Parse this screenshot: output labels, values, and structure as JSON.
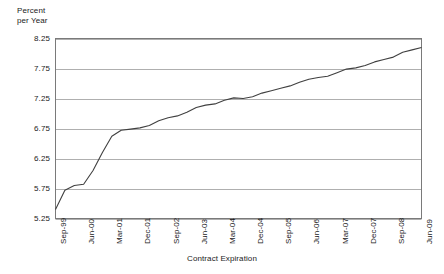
{
  "chart_data": {
    "type": "line",
    "title": "",
    "xlabel": "Contract Expiration",
    "ylabel": "Percent\nper Year",
    "ylabel_line1": "Percent",
    "ylabel_line2": "per Year",
    "ylim": [
      5.25,
      8.25
    ],
    "ytick_labels": [
      "8.25",
      "7.75",
      "7.25",
      "6.75",
      "6.25",
      "5.75",
      "5.25"
    ],
    "ytick_values": [
      8.25,
      7.75,
      7.25,
      6.75,
      6.25,
      5.75,
      5.25
    ],
    "xtick_labels": [
      "Sep-99",
      "Jun-00",
      "Mar-01",
      "Dec-01",
      "Sep-02",
      "Jun-03",
      "Mar-04",
      "Dec-04",
      "Sep-05",
      "Jun-06",
      "Mar-07",
      "Dec-07",
      "Sep-08",
      "Jun-09"
    ],
    "grid": "horizontal",
    "legend": "none",
    "line_color": "#404040",
    "series_name": "Forward rate curve",
    "x": [
      "Sep-99",
      "Dec-99",
      "Mar-00",
      "Jun-00",
      "Sep-00",
      "Dec-00",
      "Mar-01",
      "Jun-01",
      "Sep-01",
      "Dec-01",
      "Mar-02",
      "Jun-02",
      "Sep-02",
      "Dec-02",
      "Mar-03",
      "Jun-03",
      "Sep-03",
      "Dec-03",
      "Mar-04",
      "Jun-04",
      "Sep-04",
      "Dec-04",
      "Mar-05",
      "Jun-05",
      "Sep-05",
      "Dec-05",
      "Mar-06",
      "Jun-06",
      "Sep-06",
      "Dec-06",
      "Mar-07",
      "Jun-07",
      "Sep-07",
      "Dec-07",
      "Mar-08",
      "Jun-08",
      "Sep-08",
      "Dec-08",
      "Mar-09",
      "Jun-09"
    ],
    "values": [
      5.4,
      5.72,
      5.8,
      5.82,
      6.05,
      6.35,
      6.62,
      6.72,
      6.74,
      6.76,
      6.8,
      6.88,
      6.93,
      6.96,
      7.02,
      7.1,
      7.14,
      7.16,
      7.22,
      7.26,
      7.25,
      7.28,
      7.34,
      7.38,
      7.42,
      7.46,
      7.52,
      7.57,
      7.6,
      7.62,
      7.68,
      7.74,
      7.76,
      7.8,
      7.86,
      7.9,
      7.94,
      8.02,
      8.06,
      8.1
    ]
  }
}
